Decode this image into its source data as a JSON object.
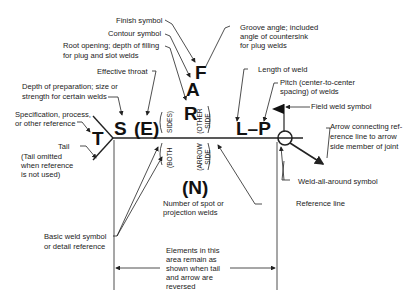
{
  "symbols": {
    "F": "F",
    "A": "A",
    "R": "R",
    "S": "S",
    "E": "(E)",
    "T": "T",
    "L_P": "L–P",
    "N": "(N)"
  },
  "side_labels": {
    "both_sides_top": "SIDES)",
    "both_sides_bottom": "(BOTH",
    "other_side": "(OTHER SIDE",
    "arrow_side": "(ARROW SIDE"
  },
  "labels": {
    "finish_symbol": "Finish symbol",
    "contour_symbol": "Contour symbol",
    "root_opening": [
      "Root opening; depth of filling",
      "for plug and slot welds"
    ],
    "effective_throat": "Effective throat",
    "depth_of_preparation": [
      "Depth of preparation; size or",
      "strength for certain welds"
    ],
    "specification": [
      "Specification, process,",
      "or other reference"
    ],
    "tail": "Tail",
    "tail_note": [
      "(Tail omitted",
      "when reference",
      "is not used)"
    ],
    "groove_angle": [
      "Groove angle; included",
      "angle of countersink",
      "for plug welds"
    ],
    "length_of_weld": "Length of weld",
    "pitch": [
      "Pitch (center-to-center",
      "spacing) of welds"
    ],
    "field_weld_symbol": "Field weld symbol",
    "arrow_connecting": [
      "Arrow connecting ref-",
      "erence line to arrow",
      "side member of joint"
    ],
    "weld_all_around": "Weld-all-around symbol",
    "reference_line": "Reference line",
    "number_of_spot": [
      "Number of spot or",
      "projection welds"
    ],
    "basic_weld_symbol": [
      "Basic weld symbol",
      "or detail reference"
    ],
    "elements_note": [
      "Elements in this",
      "area remain as",
      "shown when tail",
      "and arrow are",
      "reversed"
    ]
  }
}
